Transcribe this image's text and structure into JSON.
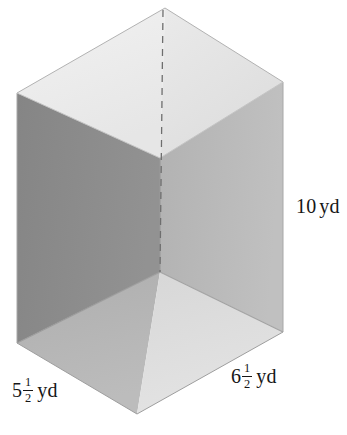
{
  "figure": {
    "shape": "rectangular-prism",
    "view": "isometric-open-box",
    "background_color": "#ffffff",
    "labels": {
      "height": {
        "name": "height-label",
        "value": "10",
        "whole": "10",
        "unit": "yd",
        "full_text": "10 yd"
      },
      "width": {
        "name": "width-label",
        "whole": "5",
        "numerator": "1",
        "denominator": "2",
        "unit": "yd",
        "full_text": "5 1/2 yd"
      },
      "depth": {
        "name": "depth-label",
        "whole": "6",
        "numerator": "1",
        "denominator": "2",
        "unit": "yd",
        "full_text": "6 1/2 yd"
      }
    },
    "faces": {
      "top_left": {
        "name": "top-face-left",
        "color": "#eeeeee"
      },
      "top_right": {
        "name": "top-face-right",
        "color": "#e4e4e4"
      },
      "wall_left": {
        "name": "interior-wall-left",
        "color": "#8b8b8b"
      },
      "wall_right": {
        "name": "interior-wall-right",
        "color": "#b9b9b9"
      },
      "floor_left": {
        "name": "interior-floor-left",
        "color": "#b4b4b4"
      },
      "floor_right": {
        "name": "interior-floor-right",
        "color": "#dddddd"
      },
      "outer_left": {
        "name": "outer-face-left",
        "color": "#9b9b9b"
      },
      "rim": {
        "name": "rim-edge",
        "color": "#cfcfcf"
      }
    },
    "edges": {
      "hidden_edge": {
        "name": "hidden-back-vertical-edge",
        "style": "dashed",
        "color": "#6e6e6e"
      },
      "visible_edge_color": "#9a9a9a"
    },
    "text_color": "#161616"
  }
}
